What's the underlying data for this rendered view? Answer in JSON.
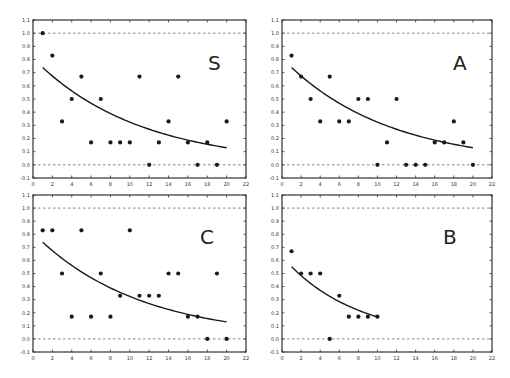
{
  "chart_data": [
    {
      "type": "scatter",
      "title": "",
      "panel_label": "S",
      "xlabel": "",
      "ylabel": "",
      "xlim": [
        0,
        22
      ],
      "ylim": [
        -0.1,
        1.1
      ],
      "xticks": [
        0,
        2,
        4,
        6,
        8,
        10,
        12,
        14,
        16,
        18,
        20,
        22
      ],
      "yticks": [
        -0.1,
        0.0,
        0.1,
        0.2,
        0.3,
        0.4,
        0.5,
        0.6,
        0.7,
        0.8,
        0.9,
        1.0,
        1.1
      ],
      "reference_lines": [
        0.0,
        1.0
      ],
      "grid": false,
      "x": [
        1,
        2,
        3,
        4,
        5,
        6,
        7,
        8,
        9,
        10,
        11,
        12,
        13,
        14,
        15,
        16,
        17,
        18,
        19,
        20
      ],
      "y": [
        1.0,
        0.83,
        0.33,
        0.5,
        0.67,
        0.17,
        0.5,
        0.17,
        0.17,
        0.17,
        0.67,
        0.0,
        0.17,
        0.33,
        0.67,
        0.17,
        0.0,
        0.17,
        0.0,
        0.33
      ],
      "fit_curve": {
        "x_range": [
          1,
          20
        ],
        "a": 0.81,
        "b": 0.0915,
        "y_start": 0.74,
        "y_end": 0.13
      }
    },
    {
      "type": "scatter",
      "title": "",
      "panel_label": "A",
      "xlabel": "",
      "ylabel": "",
      "xlim": [
        0,
        22
      ],
      "ylim": [
        -0.1,
        1.1
      ],
      "xticks": [
        0,
        2,
        4,
        6,
        8,
        10,
        12,
        14,
        16,
        18,
        20,
        22
      ],
      "yticks": [
        -0.1,
        0.0,
        0.1,
        0.2,
        0.3,
        0.4,
        0.5,
        0.6,
        0.7,
        0.8,
        0.9,
        1.0,
        1.1
      ],
      "reference_lines": [
        0.0,
        1.0
      ],
      "grid": false,
      "x": [
        1,
        2,
        3,
        4,
        5,
        6,
        7,
        8,
        9,
        10,
        11,
        12,
        13,
        14,
        15,
        16,
        17,
        18,
        19,
        20
      ],
      "y": [
        0.83,
        0.67,
        0.5,
        0.33,
        0.67,
        0.33,
        0.33,
        0.5,
        0.5,
        0.0,
        0.17,
        0.5,
        0.0,
        0.0,
        0.0,
        0.17,
        0.17,
        0.33,
        0.17,
        0.0
      ],
      "fit_curve": {
        "x_range": [
          1,
          20
        ],
        "a": 0.81,
        "b": 0.0915,
        "y_start": 0.74,
        "y_end": 0.13
      }
    },
    {
      "type": "scatter",
      "title": "",
      "panel_label": "C",
      "xlabel": "",
      "ylabel": "",
      "xlim": [
        0,
        22
      ],
      "ylim": [
        -0.1,
        1.1
      ],
      "xticks": [
        0,
        2,
        4,
        6,
        8,
        10,
        12,
        14,
        16,
        18,
        20,
        22
      ],
      "yticks": [
        -0.1,
        0.0,
        0.1,
        0.2,
        0.3,
        0.4,
        0.5,
        0.6,
        0.7,
        0.8,
        0.9,
        1.0,
        1.1
      ],
      "reference_lines": [
        0.0,
        1.0
      ],
      "grid": false,
      "x": [
        1,
        2,
        3,
        4,
        5,
        6,
        7,
        8,
        9,
        10,
        11,
        12,
        13,
        14,
        15,
        16,
        17,
        18,
        19,
        20
      ],
      "y": [
        0.83,
        0.83,
        0.5,
        0.17,
        0.83,
        0.17,
        0.5,
        0.17,
        0.33,
        0.83,
        0.33,
        0.33,
        0.33,
        0.5,
        0.5,
        0.17,
        0.17,
        0.0,
        0.5,
        0.0
      ],
      "fit_curve": {
        "x_range": [
          1,
          20
        ],
        "a": 0.81,
        "b": 0.0915,
        "y_start": 0.74,
        "y_end": 0.13
      }
    },
    {
      "type": "scatter",
      "title": "",
      "panel_label": "B",
      "xlabel": "",
      "ylabel": "",
      "xlim": [
        0,
        22
      ],
      "ylim": [
        -0.1,
        1.1
      ],
      "xticks": [
        0,
        2,
        4,
        6,
        8,
        10,
        12,
        14,
        16,
        18,
        20,
        22
      ],
      "yticks": [
        -0.1,
        0.0,
        0.1,
        0.2,
        0.3,
        0.4,
        0.5,
        0.6,
        0.7,
        0.8,
        0.9,
        1.0,
        1.1
      ],
      "reference_lines": [
        0.0,
        1.0
      ],
      "grid": false,
      "x": [
        1,
        2,
        3,
        4,
        5,
        6,
        7,
        8,
        9,
        10
      ],
      "y": [
        0.67,
        0.5,
        0.5,
        0.5,
        0.0,
        0.33,
        0.17,
        0.17,
        0.17,
        0.17
      ],
      "fit_curve": {
        "x_range": [
          1,
          10
        ],
        "a": 0.63,
        "b": 0.132,
        "y_start": 0.55,
        "y_end": 0.17
      }
    }
  ],
  "layout": {
    "panels": [
      {
        "left": 33,
        "top": 20,
        "right": 246,
        "bottom": 178
      },
      {
        "left": 282,
        "top": 20,
        "right": 492,
        "bottom": 178
      },
      {
        "left": 33,
        "top": 195,
        "right": 246,
        "bottom": 352
      },
      {
        "left": 282,
        "top": 195,
        "right": 492,
        "bottom": 352
      }
    ],
    "label_positions": [
      {
        "x": 208,
        "y": 70
      },
      {
        "x": 453,
        "y": 70
      },
      {
        "x": 200,
        "y": 244
      },
      {
        "x": 443,
        "y": 244
      }
    ]
  },
  "colors": {
    "ink": "#1a1a1a",
    "axis": "#333333",
    "dashed": "#666666",
    "background": "#ffffff"
  }
}
